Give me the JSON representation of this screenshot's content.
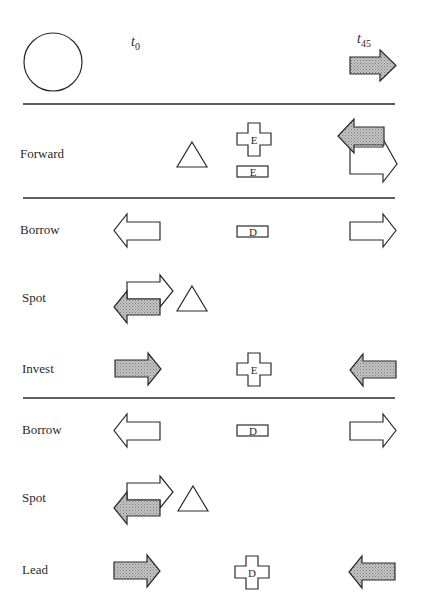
{
  "header": {
    "time_start": {
      "symbol": "t",
      "subscript": "0"
    },
    "time_end": {
      "symbol": "t",
      "subscript": "45"
    }
  },
  "colors": {
    "ink": "#2a2a2a",
    "shaded_fill": "#b8b8b8",
    "background": "#ffffff"
  },
  "legend_shapes": {
    "circle": "start-marker",
    "triangle": "spot-exchange-marker",
    "cross": "interest-marker",
    "rect": "rate-marker"
  },
  "sections": [
    {
      "rows": [
        {
          "label": "Forward",
          "cross_label": "E",
          "rect_label": "E"
        }
      ]
    },
    {
      "rows": [
        {
          "label": "Borrow",
          "rect_label": "D"
        },
        {
          "label": "Spot"
        },
        {
          "label": "Invest",
          "cross_label": "E"
        }
      ]
    },
    {
      "rows": [
        {
          "label": "Borrow",
          "rect_label": "D"
        },
        {
          "label": "Spot"
        },
        {
          "label": "Lead",
          "cross_label": "D"
        }
      ]
    }
  ]
}
